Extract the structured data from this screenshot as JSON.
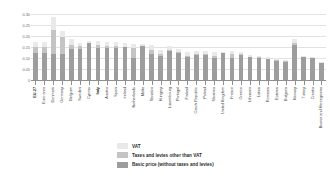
{
  "chart_data": {
    "type": "bar",
    "subtype": "stacked-bar",
    "title": "",
    "xlabel": "",
    "ylabel": "",
    "ylim": [
      0,
      0.3
    ],
    "ytick_labels": [
      "0.30",
      "0.25",
      "0.20",
      "0.15",
      "0.10",
      "0.05",
      "0"
    ],
    "ytick_values": [
      0.3,
      0.25,
      0.2,
      0.15,
      0.1,
      0.05,
      0
    ],
    "grid": true,
    "legend_position": "bottom",
    "categories": [
      "EU-27",
      "Euro area",
      "Denmark",
      "Germany",
      "Belgium",
      "Sweden",
      "Cyprus",
      "Italy",
      "Austria",
      "Spain",
      "Ireland",
      "Netherlands",
      "Malta",
      "Slovakia",
      "Hungary",
      "Luxembourg",
      "Portugal",
      "Finland",
      "Czech Republic",
      "Poland",
      "Slovenia",
      "United Kingdom",
      "France",
      "Greece",
      "Lithuania",
      "Latvia",
      "Romania",
      "Estonia",
      "Bulgaria",
      "Norway",
      "Turkey",
      "Croatia",
      "Bosnia and Herzegovina"
    ],
    "bold_categories": [
      "EU-27",
      "Italy"
    ],
    "series": [
      {
        "name": "Basic price (without taxes and levies)",
        "color": "#9d9d9d",
        "values": [
          0.123,
          0.122,
          0.118,
          0.116,
          0.141,
          0.143,
          0.168,
          0.146,
          0.144,
          0.146,
          0.15,
          0.098,
          0.154,
          0.12,
          0.108,
          0.133,
          0.123,
          0.104,
          0.113,
          0.114,
          0.098,
          0.122,
          0.102,
          0.112,
          0.105,
          0.101,
          0.094,
          0.088,
          0.083,
          0.16,
          0.103,
          0.098,
          0.079
        ]
      },
      {
        "name": "Taxes and levies other than VAT",
        "color": "#c4c4c4",
        "values": [
          0.028,
          0.03,
          0.111,
          0.078,
          0.018,
          0.01,
          0.0,
          0.014,
          0.011,
          0.009,
          0.0,
          0.046,
          0.0,
          0.016,
          0.012,
          0.002,
          0.004,
          0.004,
          0.006,
          0.005,
          0.011,
          0.0,
          0.016,
          0.008,
          0.0,
          0.003,
          0.003,
          0.004,
          0.002,
          0.007,
          0.0,
          0.0,
          0.0
        ]
      },
      {
        "name": "VAT",
        "color": "#e9e9e9",
        "values": [
          0.021,
          0.022,
          0.057,
          0.031,
          0.027,
          0.015,
          0.009,
          0.018,
          0.017,
          0.017,
          0.016,
          0.02,
          0.01,
          0.022,
          0.017,
          0.02,
          0.013,
          0.018,
          0.015,
          0.015,
          0.018,
          0.005,
          0.013,
          0.008,
          0.011,
          0.007,
          0.006,
          0.01,
          0.006,
          0.018,
          0.007,
          0.005,
          0.001
        ]
      }
    ],
    "legend": [
      {
        "label": "VAT",
        "color": "#e9e9e9"
      },
      {
        "label": "Taxes and levies other than VAT",
        "color": "#c4c4c4"
      },
      {
        "label": "Basic price (without taxes and levies)",
        "color": "#9d9d9d"
      }
    ]
  }
}
